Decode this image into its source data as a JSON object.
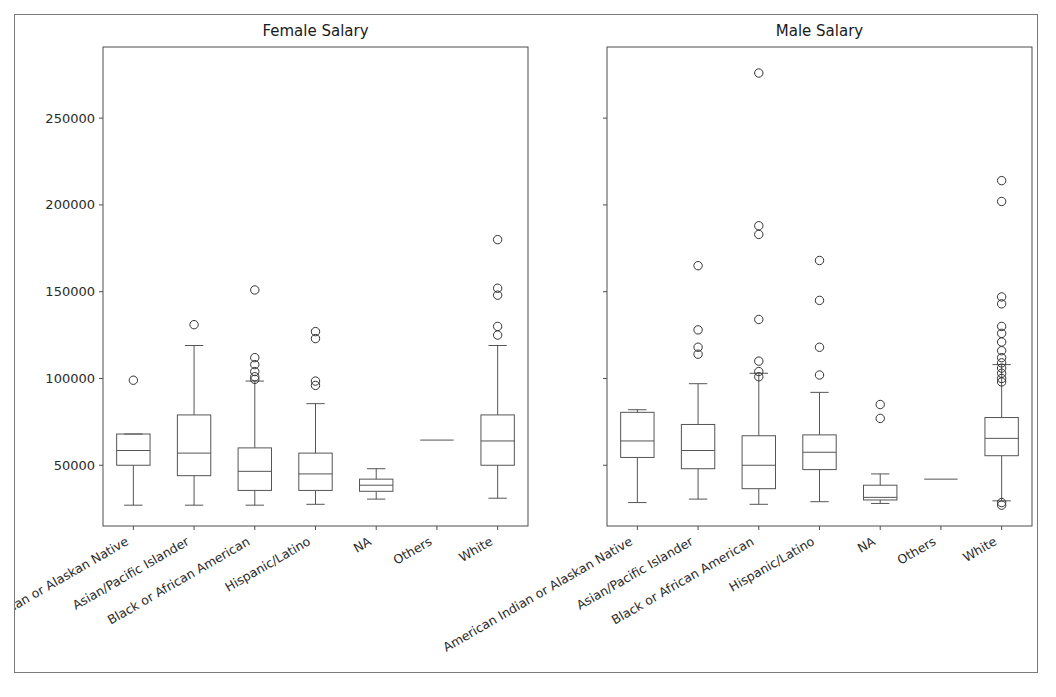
{
  "figure": {
    "background": "#ffffff",
    "frame_color": "#7a7a7a",
    "line_color": "#555555"
  },
  "chart_data": {
    "type": "box",
    "title": "",
    "panels": [
      {
        "title": "Female Salary",
        "xlabel": "",
        "ylabel": "",
        "show_yticks": true
      },
      {
        "title": "Male Salary",
        "xlabel": "",
        "ylabel": "",
        "show_yticks": false
      }
    ],
    "categories": [
      "American Indian or Alaskan Native",
      "Asian/Pacific Islander",
      "Black or African American",
      "Hispanic/Latino",
      "NA",
      "Others",
      "White"
    ],
    "ylim": [
      15000,
      291000
    ],
    "yticks": [
      50000,
      100000,
      150000,
      200000,
      250000
    ],
    "ytick_labels": [
      "50000",
      "100000",
      "150000",
      "200000",
      "250000"
    ],
    "grid": false,
    "legend": null,
    "series": [
      {
        "name": "Female Salary",
        "boxes": [
          {
            "category": "American Indian or Alaskan Native",
            "whisker_low": 27000,
            "q1": 50000,
            "median": 58500,
            "q3": 68000,
            "whisker_high": 68000,
            "fliers": [
              99000
            ]
          },
          {
            "category": "Asian/Pacific Islander",
            "whisker_low": 27000,
            "q1": 44000,
            "median": 57000,
            "q3": 79000,
            "whisker_high": 119000,
            "fliers": [
              131000
            ]
          },
          {
            "category": "Black or African American",
            "whisker_low": 27000,
            "q1": 35500,
            "median": 46500,
            "q3": 60000,
            "whisker_high": 98500,
            "fliers": [
              151000,
              112000,
              108000,
              104000,
              101000,
              99500
            ]
          },
          {
            "category": "Hispanic/Latino",
            "whisker_low": 27500,
            "q1": 35500,
            "median": 45000,
            "q3": 57000,
            "whisker_high": 85500,
            "fliers": [
              127000,
              123000,
              98500,
              96000
            ]
          },
          {
            "category": "NA",
            "whisker_low": 30500,
            "q1": 35000,
            "median": 38500,
            "q3": 42000,
            "whisker_high": 48000,
            "fliers": []
          },
          {
            "category": "Others",
            "whisker_low": 64500,
            "q1": 64500,
            "median": 64500,
            "q3": 64500,
            "whisker_high": 64500,
            "fliers": []
          },
          {
            "category": "White",
            "whisker_low": 31000,
            "q1": 50000,
            "median": 64000,
            "q3": 79000,
            "whisker_high": 119000,
            "fliers": [
              180000,
              152000,
              148000,
              130000,
              125000
            ]
          }
        ]
      },
      {
        "name": "Male Salary",
        "boxes": [
          {
            "category": "American Indian or Alaskan Native",
            "whisker_low": 28500,
            "q1": 54500,
            "median": 64000,
            "q3": 80500,
            "whisker_high": 82000,
            "fliers": []
          },
          {
            "category": "Asian/Pacific Islander",
            "whisker_low": 30500,
            "q1": 48000,
            "median": 58500,
            "q3": 73500,
            "whisker_high": 97000,
            "fliers": [
              165000,
              128000,
              118000,
              114000
            ]
          },
          {
            "category": "Black or African American",
            "whisker_low": 27500,
            "q1": 36500,
            "median": 50000,
            "q3": 67000,
            "whisker_high": 103000,
            "fliers": [
              276000,
              188000,
              183000,
              134000,
              110000,
              104000,
              101000
            ]
          },
          {
            "category": "Hispanic/Latino",
            "whisker_low": 29000,
            "q1": 47500,
            "median": 57500,
            "q3": 67500,
            "whisker_high": 92000,
            "fliers": [
              168000,
              145000,
              118000,
              102000
            ]
          },
          {
            "category": "NA",
            "whisker_low": 28000,
            "q1": 30000,
            "median": 31500,
            "q3": 38500,
            "whisker_high": 45000,
            "fliers": [
              85000,
              77000
            ]
          },
          {
            "category": "Others",
            "whisker_low": 42000,
            "q1": 42000,
            "median": 42000,
            "q3": 42000,
            "whisker_high": 42000,
            "fliers": []
          },
          {
            "category": "White",
            "whisker_low": 29500,
            "q1": 55500,
            "median": 65500,
            "q3": 77500,
            "whisker_high": 108000,
            "fliers": [
              214000,
              202000,
              147000,
              143000,
              130000,
              126000,
              121000,
              116000,
              112000,
              109000,
              106000,
              103000,
              100000,
              98000,
              28500,
              27000
            ]
          }
        ]
      }
    ]
  }
}
